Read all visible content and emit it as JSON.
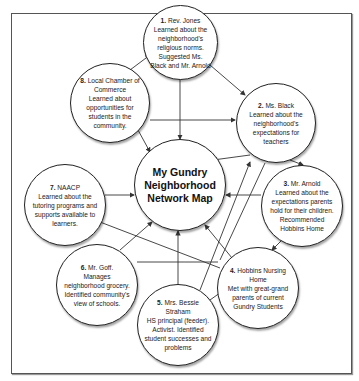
{
  "diagram": {
    "title": "My Gundry Neighborhood Network Map",
    "title_lines": [
      "My Gundry",
      "Neighborhood",
      "Network Map"
    ],
    "nodes": [
      {
        "num": "1.",
        "name": "Rev. Jones",
        "text": "Learned about the neighborhood's religious norms. Suggested Ms. Black and Mr. Arnold"
      },
      {
        "num": "2.",
        "name": "Ms. Black",
        "text": "Learned about the neighborhood's expectations for teachers"
      },
      {
        "num": "3.",
        "name": "Mr. Arnold",
        "text": "Learned about the expectations parents hold for their children. Recommended Hobbins Home"
      },
      {
        "num": "4.",
        "name": "Hobbins Nursing Home",
        "text": "Met with great-grand parents of current Gundry Students"
      },
      {
        "num": "5.",
        "name": "Mrs. Bessie Straham",
        "text": "HS principal (feeder). Activist. Identified student successes and problems"
      },
      {
        "num": "6.",
        "name": "Mr. Goff.",
        "text": "Manages neighborhood grocery. Identified community's view of schools."
      },
      {
        "num": "7.",
        "name": "NAACP",
        "text": "Learned about the tutoring programs and supports available to learners."
      },
      {
        "num": "8.",
        "name": "Local Chamber of Commerce",
        "text": "Learned about opportunities for students in the community."
      }
    ]
  }
}
